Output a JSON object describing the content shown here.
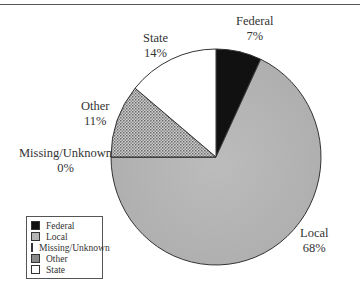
{
  "chart_data": {
    "type": "pie",
    "title": "",
    "categories": [
      "Federal",
      "Local",
      "Missing/Unknown",
      "Other",
      "State"
    ],
    "values": [
      7,
      68,
      0,
      11,
      14
    ],
    "unit": "%",
    "colors": {
      "Federal": "#111111",
      "Local": "#b5b5b5",
      "Missing/Unknown": "#111111",
      "Other": "#9a9a9a",
      "State": "#ffffff"
    },
    "start_angle": "12 o'clock, clockwise",
    "legend_position": "lower-left",
    "slice_labels": [
      {
        "name": "Federal",
        "pct": "7%"
      },
      {
        "name": "Local",
        "pct": "68%"
      },
      {
        "name": "Missing/Unknown",
        "pct": "0%"
      },
      {
        "name": "Other",
        "pct": "11%"
      },
      {
        "name": "State",
        "pct": "14%"
      }
    ]
  },
  "legend": {
    "items": [
      {
        "label": "Federal",
        "color": "#111111"
      },
      {
        "label": "Local",
        "color": "#b5b5b5"
      },
      {
        "label": "Missing/Unknown",
        "color": "#111111"
      },
      {
        "label": "Other",
        "color": "#8a8a8a"
      },
      {
        "label": "State",
        "color": "#ffffff"
      }
    ]
  }
}
